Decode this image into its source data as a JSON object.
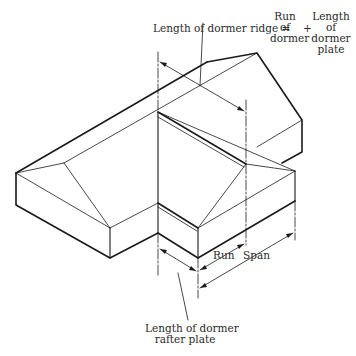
{
  "figure": {
    "type": "isometric roof framing diagram"
  },
  "labels": {
    "ridge_formula_left": "Length of dormer ridge =",
    "term1_line1": "Run",
    "term1_line2": "of",
    "term1_line3": "dormer",
    "plus": "+",
    "term2_line1": "Length",
    "term2_line2": "of",
    "term2_line3": "dormer",
    "term2_line4": "plate",
    "run": "Run",
    "span": "Span",
    "rafter_plate_line1": "Length of dormer",
    "rafter_plate_line2": "rafter plate"
  },
  "colors": {
    "line": "#1a1a1a",
    "text": "#2a2a2a",
    "background": "#ffffff"
  }
}
